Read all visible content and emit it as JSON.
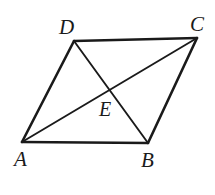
{
  "figure": {
    "type": "geometry-diagram",
    "shape": "parallelogram-with-diagonals",
    "background_color": "#ffffff",
    "stroke_color": "#1a1a1a",
    "canvas": {
      "width": 215,
      "height": 195
    },
    "vertices": [
      {
        "id": "A",
        "label": "A",
        "x": 22,
        "y": 142
      },
      {
        "id": "B",
        "label": "B",
        "x": 148,
        "y": 143
      },
      {
        "id": "C",
        "label": "C",
        "x": 197,
        "y": 38
      },
      {
        "id": "D",
        "label": "D",
        "x": 74,
        "y": 41
      },
      {
        "id": "E",
        "label": "E",
        "x": 110,
        "y": 89
      }
    ],
    "sides": [
      {
        "name": "AB",
        "from": "A",
        "to": "B",
        "x1": 22,
        "y1": 142,
        "x2": 148,
        "y2": 143,
        "width": 2.6
      },
      {
        "name": "BC",
        "from": "B",
        "to": "C",
        "x1": 148,
        "y1": 143,
        "x2": 197,
        "y2": 38,
        "width": 2.6
      },
      {
        "name": "CD",
        "from": "C",
        "to": "D",
        "x1": 197,
        "y1": 38,
        "x2": 74,
        "y2": 41,
        "width": 2.6
      },
      {
        "name": "DA",
        "from": "D",
        "to": "A",
        "x1": 74,
        "y1": 41,
        "x2": 22,
        "y2": 142,
        "width": 2.6
      }
    ],
    "diagonals": [
      {
        "name": "AC",
        "from": "A",
        "to": "C",
        "x1": 22,
        "y1": 142,
        "x2": 197,
        "y2": 38,
        "width": 1.9
      },
      {
        "name": "DB",
        "from": "D",
        "to": "B",
        "x1": 74,
        "y1": 41,
        "x2": 148,
        "y2": 143,
        "width": 1.9
      }
    ],
    "labels": {
      "A": "A",
      "B": "B",
      "C": "C",
      "D": "D",
      "E": "E"
    }
  }
}
